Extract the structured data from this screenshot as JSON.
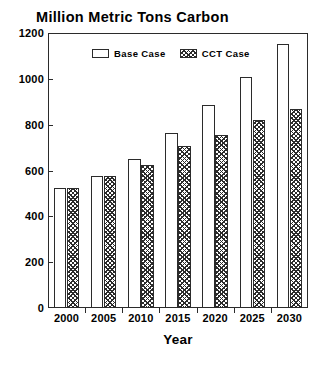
{
  "chart_data": {
    "type": "bar",
    "title": "Million Metric Tons Carbon",
    "xlabel": "Year",
    "ylabel": "",
    "categories": [
      "2000",
      "2005",
      "2010",
      "2015",
      "2020",
      "2025",
      "2030"
    ],
    "series": [
      {
        "name": "Base Case",
        "values": [
          525,
          575,
          650,
          765,
          885,
          1010,
          1150
        ]
      },
      {
        "name": "CCT Case",
        "values": [
          525,
          575,
          625,
          705,
          755,
          820,
          870
        ]
      }
    ],
    "ylim": [
      0,
      1200
    ],
    "y_ticks": [
      0,
      200,
      400,
      600,
      800,
      1000,
      1200
    ],
    "y_tick_labels": [
      "0",
      "200",
      "400",
      "600",
      "800",
      "1000",
      "1200"
    ],
    "grid": false,
    "legend_position": "top-center",
    "legend": [
      "Base Case",
      "CCT Case"
    ],
    "colors": {
      "axis": "#2b2b2b",
      "text": "#000000",
      "background": "#ffffff",
      "base_case_fill": "#ffffff",
      "cct_case_hatch": "#2b2b2b"
    }
  }
}
